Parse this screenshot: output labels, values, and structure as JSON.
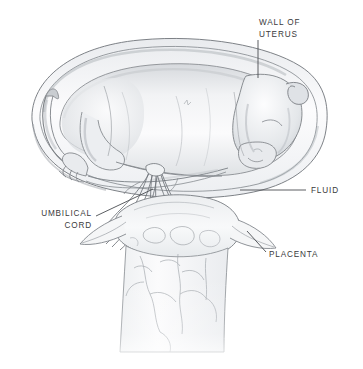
{
  "figure": {
    "style": "graphite pencil medical illustration",
    "background_color": "#ffffff",
    "ink_color": "#3a3a3c",
    "shading_color": "#b9bcc0",
    "width": 363,
    "height": 369
  },
  "labels": {
    "uterus": {
      "line1": "WALL OF",
      "line2": "UTERUS",
      "text": "WALL OF\nUTERUS"
    },
    "fluid": {
      "text": "FLUID"
    },
    "placenta": {
      "text": "PLACENTA"
    },
    "umbilical_cord": {
      "line1": "UMBILICAL",
      "line2": "CORD",
      "text": "UMBILICAL\nCORD"
    }
  },
  "leader_lines": {
    "uterus": {
      "from_x": 258,
      "from_y": 40,
      "to_x": 258,
      "to_y": 78,
      "orientation": "vertical"
    },
    "fluid": {
      "from_x": 240,
      "from_y": 190,
      "to_x": 306,
      "to_y": 190,
      "orientation": "horizontal"
    },
    "placenta": {
      "from_x": 248,
      "from_y": 232,
      "to_x": 266,
      "to_y": 252,
      "orientation": "diagonal"
    },
    "umbilical_cord": {
      "from_x": 96,
      "from_y": 216,
      "to_x": 152,
      "to_y": 190,
      "orientation": "diagonal"
    }
  },
  "structures": [
    {
      "name": "uterine-wall",
      "description": "large oval double-outlined membrane enclosing the fetus"
    },
    {
      "name": "fetus",
      "description": "curled quadruped fetus lying horizontally, head to the right"
    },
    {
      "name": "fetal-head",
      "description": "head curled down at right with visible ear"
    },
    {
      "name": "fetal-tail",
      "description": "tail curving up at left"
    },
    {
      "name": "fore-hooves",
      "description": "front limbs with hooves extending to lower left"
    },
    {
      "name": "umbilical-cord",
      "description": "twisted bundle of vessels from fetal abdomen to placenta"
    },
    {
      "name": "placenta",
      "description": "placental body with lateral membrane horns"
    },
    {
      "name": "cervix-tube",
      "description": "pale vertical tube below placenta with faint branching vessels"
    },
    {
      "name": "amniotic-fluid",
      "description": "clear space between fetus and uterine wall"
    }
  ]
}
